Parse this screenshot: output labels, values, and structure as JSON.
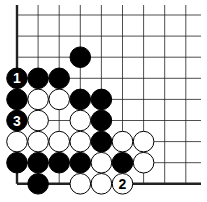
{
  "diagram": {
    "type": "go-board-fragment",
    "columns": 9,
    "rows": 9,
    "origin": {
      "x": 17,
      "y": 15
    },
    "spacing": 21.1,
    "stone_radius": 10.3,
    "colors": {
      "black": "#000000",
      "white": "#ffffff",
      "line": "#222222"
    },
    "edges": [
      "left",
      "bottom"
    ],
    "stones": [
      {
        "color": "black",
        "col": 3,
        "row": 2,
        "label": ""
      },
      {
        "color": "black",
        "col": 0,
        "row": 3,
        "label": "1"
      },
      {
        "color": "black",
        "col": 1,
        "row": 3,
        "label": ""
      },
      {
        "color": "black",
        "col": 2,
        "row": 3,
        "label": ""
      },
      {
        "color": "black",
        "col": 0,
        "row": 4,
        "label": ""
      },
      {
        "color": "white",
        "col": 1,
        "row": 4,
        "label": ""
      },
      {
        "color": "white",
        "col": 2,
        "row": 4,
        "label": ""
      },
      {
        "color": "black",
        "col": 3,
        "row": 4,
        "label": ""
      },
      {
        "color": "black",
        "col": 4,
        "row": 4,
        "label": ""
      },
      {
        "color": "black",
        "col": 0,
        "row": 5,
        "label": "3"
      },
      {
        "color": "white",
        "col": 1,
        "row": 5,
        "label": ""
      },
      {
        "color": "white",
        "col": 3,
        "row": 5,
        "label": ""
      },
      {
        "color": "black",
        "col": 4,
        "row": 5,
        "label": ""
      },
      {
        "color": "white",
        "col": 0,
        "row": 6,
        "label": ""
      },
      {
        "color": "white",
        "col": 1,
        "row": 6,
        "label": ""
      },
      {
        "color": "white",
        "col": 2,
        "row": 6,
        "label": ""
      },
      {
        "color": "white",
        "col": 3,
        "row": 6,
        "label": ""
      },
      {
        "color": "black",
        "col": 4,
        "row": 6,
        "label": ""
      },
      {
        "color": "white",
        "col": 5,
        "row": 6,
        "label": ""
      },
      {
        "color": "white",
        "col": 6,
        "row": 6,
        "label": ""
      },
      {
        "color": "black",
        "col": 0,
        "row": 7,
        "label": ""
      },
      {
        "color": "black",
        "col": 1,
        "row": 7,
        "label": ""
      },
      {
        "color": "black",
        "col": 2,
        "row": 7,
        "label": ""
      },
      {
        "color": "black",
        "col": 3,
        "row": 7,
        "label": ""
      },
      {
        "color": "white",
        "col": 4,
        "row": 7,
        "label": ""
      },
      {
        "color": "black",
        "col": 5,
        "row": 7,
        "label": ""
      },
      {
        "color": "white",
        "col": 6,
        "row": 7,
        "label": ""
      },
      {
        "color": "black",
        "col": 1,
        "row": 8,
        "label": ""
      },
      {
        "color": "white",
        "col": 3,
        "row": 8,
        "label": ""
      },
      {
        "color": "white",
        "col": 4,
        "row": 8,
        "label": ""
      },
      {
        "color": "white",
        "col": 5,
        "row": 8,
        "label": "2"
      }
    ]
  }
}
